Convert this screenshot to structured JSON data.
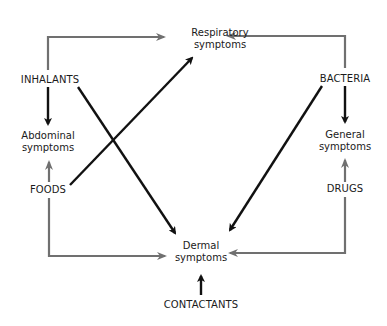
{
  "nodes": {
    "respiratory": {
      "line1": "Respiratory",
      "line2": "symptoms"
    },
    "inhalants": {
      "label": "INHALANTS"
    },
    "bacteria": {
      "label": "BACTERIA"
    },
    "abdominal": {
      "line1": "Abdominal",
      "line2": "symptoms"
    },
    "general": {
      "line1": "General",
      "line2": "symptoms"
    },
    "foods": {
      "label": "FOODS"
    },
    "drugs": {
      "label": "DRUGS"
    },
    "dermal": {
      "line1": "Dermal",
      "line2": "symptoms"
    },
    "contactants": {
      "label": "CONTACTANTS"
    }
  },
  "colors": {
    "black_arrow": "#111111",
    "gray_arrow": "#707070",
    "text": "#1a1a1a"
  },
  "edges": [
    {
      "from": "INHALANTS",
      "to": "Respiratory symptoms",
      "color": "gray"
    },
    {
      "from": "INHALANTS",
      "to": "Abdominal symptoms",
      "color": "black"
    },
    {
      "from": "INHALANTS",
      "to": "Dermal symptoms",
      "color": "black"
    },
    {
      "from": "FOODS",
      "to": "Abdominal symptoms",
      "color": "gray"
    },
    {
      "from": "FOODS",
      "to": "Respiratory symptoms",
      "color": "black"
    },
    {
      "from": "FOODS",
      "to": "Dermal symptoms",
      "color": "gray"
    },
    {
      "from": "BACTERIA",
      "to": "Respiratory symptoms",
      "color": "gray"
    },
    {
      "from": "BACTERIA",
      "to": "General symptoms",
      "color": "black"
    },
    {
      "from": "BACTERIA",
      "to": "Dermal symptoms",
      "color": "black"
    },
    {
      "from": "DRUGS",
      "to": "General symptoms",
      "color": "gray"
    },
    {
      "from": "DRUGS",
      "to": "Dermal symptoms",
      "color": "gray"
    },
    {
      "from": "CONTACTANTS",
      "to": "Dermal symptoms",
      "color": "black"
    }
  ]
}
